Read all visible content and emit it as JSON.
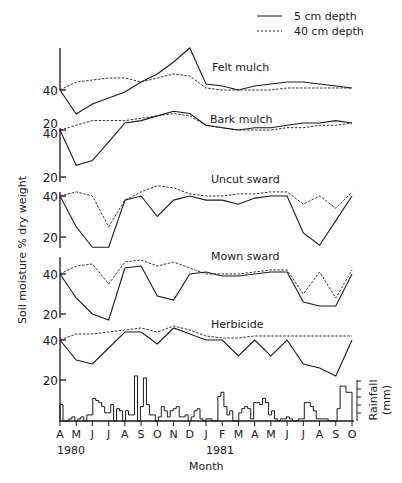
{
  "chart_data": {
    "type": "line",
    "title": "",
    "xlabel": "Month",
    "ylabel": "Soil moisture % dry weight",
    "x_months": [
      "A",
      "M",
      "J",
      "J",
      "A",
      "S",
      "O",
      "N",
      "D",
      "J",
      "F",
      "M",
      "A",
      "M",
      "J",
      "J",
      "A",
      "S",
      "O"
    ],
    "x_years": [
      {
        "label": "1980",
        "at_index": 0
      },
      {
        "label": "1981",
        "at_index": 9
      }
    ],
    "legend": [
      {
        "label": "5 cm depth",
        "style": "solid"
      },
      {
        "label": "40 cm depth",
        "style": "dashed"
      }
    ],
    "panels": [
      {
        "name": "Felt mulch",
        "yticks": [
          40
        ],
        "series": [
          {
            "name": "5 cm depth",
            "values": [
              40,
              28,
              33,
              36,
              39,
              44,
              48,
              54,
              61,
              43,
              42,
              40,
              42,
              43,
              44,
              44,
              43,
              42,
              41
            ]
          },
          {
            "name": "40 cm depth",
            "values": [
              40,
              44,
              45,
              46,
              46,
              44,
              46,
              48,
              47,
              41,
              40,
              40,
              40,
              40,
              41,
              41,
              41,
              41,
              41
            ]
          }
        ]
      },
      {
        "name": "Bark mulch",
        "yticks": [
          40,
          20
        ],
        "series": [
          {
            "name": "5 cm depth",
            "values": [
              40,
              25,
              27,
              35,
              43,
              44,
              46,
              48,
              47,
              42,
              41,
              40,
              41,
              41,
              42,
              43,
              43,
              44,
              43
            ]
          },
          {
            "name": "40 cm depth",
            "values": [
              40,
              42,
              44,
              44,
              44,
              45,
              46,
              47,
              46,
              42,
              41,
              40,
              40,
              40,
              41,
              41,
              42,
              42,
              43
            ]
          }
        ]
      },
      {
        "name": "Uncut sward",
        "yticks": [
          40,
          20
        ],
        "series": [
          {
            "name": "5 cm depth",
            "values": [
              40,
              25,
              15,
              15,
              38,
              40,
              30,
              38,
              40,
              38,
              38,
              36,
              39,
              40,
              40,
              22,
              16,
              28,
              40
            ]
          },
          {
            "name": "40 cm depth",
            "values": [
              40,
              42,
              40,
              25,
              38,
              42,
              45,
              44,
              41,
              40,
              40,
              41,
              41,
              42,
              42,
              36,
              40,
              34,
              42
            ]
          }
        ]
      },
      {
        "name": "Mown sward",
        "yticks": [
          40,
          20
        ],
        "series": [
          {
            "name": "5 cm depth",
            "values": [
              40,
              28,
              20,
              17,
              43,
              44,
              29,
              27,
              40,
              41,
              39,
              39,
              40,
              41,
              41,
              26,
              24,
              24,
              40
            ]
          },
          {
            "name": "40 cm depth",
            "values": [
              40,
              44,
              45,
              35,
              46,
              47,
              44,
              46,
              43,
              40,
              40,
              40,
              41,
              42,
              42,
              30,
              41,
              28,
              42
            ]
          }
        ]
      },
      {
        "name": "Herbicide",
        "yticks": [
          40
        ],
        "series": [
          {
            "name": "5 cm depth",
            "values": [
              40,
              30,
              28,
              36,
              44,
              44,
              38,
              46,
              43,
              40,
              40,
              32,
              40,
              32,
              40,
              28,
              26,
              22,
              40
            ]
          },
          {
            "name": "40 cm depth",
            "values": [
              40,
              43,
              43,
              44,
              45,
              46,
              44,
              47,
              45,
              42,
              41,
              41,
              42,
              42,
              42,
              42,
              42,
              42,
              42
            ]
          }
        ]
      }
    ],
    "rainfall": {
      "type": "bar",
      "ylabel": "Rainfall (mm)",
      "yticks": [
        20
      ],
      "ylim": [
        0,
        25
      ],
      "values": [
        8,
        0,
        0,
        1,
        2,
        0,
        1,
        2,
        0,
        3,
        3,
        11,
        10,
        9,
        7,
        4,
        4,
        8,
        0,
        6,
        5,
        0,
        5,
        3,
        3,
        22,
        0,
        7,
        21,
        8,
        3,
        3,
        0,
        2,
        7,
        5,
        2,
        5,
        6,
        7,
        2,
        2,
        3,
        0,
        2,
        5,
        6,
        1,
        0,
        1,
        1,
        0,
        0,
        12,
        14,
        7,
        3,
        5,
        0,
        0,
        4,
        6,
        7,
        6,
        1,
        9,
        9,
        8,
        11,
        9,
        3,
        5,
        1,
        0,
        1,
        1,
        2,
        1,
        0,
        0,
        1,
        1,
        9,
        9,
        7,
        5,
        1,
        1,
        1,
        1,
        0,
        0,
        0,
        6,
        17,
        17,
        14,
        14
      ]
    }
  },
  "labels": {
    "legend_solid": "5 cm depth",
    "legend_dashed": "40 cm depth",
    "ylabel": "Soil moisture % dry weight",
    "xlabel": "Month",
    "rain_label_1": "Rainfall",
    "rain_label_2": "(mm)",
    "year_1980": "1980",
    "year_1981": "1981",
    "panel_felt": "Felt mulch",
    "panel_bark": "Bark mulch",
    "panel_uncut": "Uncut sward",
    "panel_mown": "Mown sward",
    "panel_herb": "Herbicide",
    "tick_40": "40",
    "tick_20": "20"
  }
}
